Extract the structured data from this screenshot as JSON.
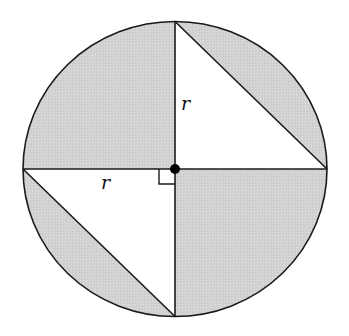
{
  "diagram": {
    "colors": {
      "stroke": "#1a1a1a",
      "shade": "#d3d3d3",
      "background": "#ffffff",
      "center_dot": "#000000"
    },
    "circle": {
      "cx": 175,
      "cy": 169,
      "rx": 152,
      "ry": 147.5
    },
    "labels": {
      "radius_vertical": "r",
      "radius_horizontal": "r"
    },
    "right_angle_marker": true,
    "shaded_regions": [
      "upper-left quarter",
      "lower-right quarter",
      "upper-right circular segment",
      "lower-left circular segment"
    ]
  }
}
